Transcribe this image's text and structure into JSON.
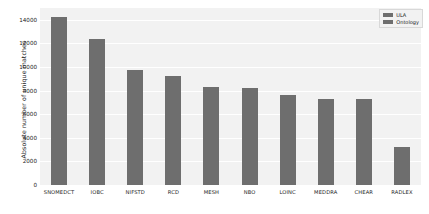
{
  "chart_data": {
    "type": "bar",
    "title": "",
    "subtitle": "",
    "xlabel": "",
    "ylabel": "Absolute number of unique matches",
    "categories": [
      "SNOMEDCT",
      "IOBC",
      "NIFSTD",
      "RCD",
      "MESH",
      "NBO",
      "LOINC",
      "MEDDRA",
      "CHEAR",
      "RADLEX"
    ],
    "values": [
      14250,
      12400,
      9750,
      9200,
      8300,
      8250,
      7600,
      7300,
      7250,
      3200
    ],
    "series": [
      {
        "name": "Ontology",
        "values": [
          14250,
          12400,
          9750,
          9200,
          8300,
          8250,
          7600,
          7300,
          7250,
          3200
        ],
        "color": "#6e6e6e"
      }
    ],
    "ylim": [
      0,
      15000
    ],
    "yticks": [
      0,
      2000,
      4000,
      6000,
      8000,
      10000,
      12000,
      14000
    ],
    "ytick_labels": [
      "0",
      "2000",
      "4000",
      "6000",
      "8000",
      "10000",
      "12000",
      "14000"
    ],
    "grid": true,
    "grid_axis": "y",
    "legend_position": "top-right",
    "legend": [
      {
        "label": "ULA",
        "color": "#6e6e6e"
      },
      {
        "label": "Ontology",
        "color": "#6e6e6e"
      }
    ],
    "plot_background": "#f2f2f2",
    "figure_background": "#ffffff"
  }
}
